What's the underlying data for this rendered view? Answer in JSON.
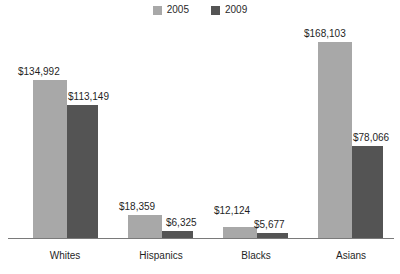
{
  "chart_data": {
    "type": "bar",
    "title": "",
    "subtitle": "",
    "xlabel": "",
    "ylabel": "",
    "grid": false,
    "legend_position": "top-center",
    "ylim": [
      0,
      185000
    ],
    "categories": [
      "Whites",
      "Hispanics",
      "Blacks",
      "Asians"
    ],
    "series": [
      {
        "name": "2005",
        "color": "#a8a8a8",
        "values": [
          134992,
          18359,
          12124,
          168103
        ],
        "labels": [
          "$134,992",
          "$18,359",
          "$12,124",
          "$168,103"
        ]
      },
      {
        "name": "2009",
        "color": "#545454",
        "values": [
          113149,
          6325,
          5677,
          78066
        ],
        "labels": [
          "$113,149",
          "$6,325",
          "$5,677",
          "$78,066"
        ]
      }
    ]
  },
  "legend": {
    "items": [
      {
        "label": "2005",
        "color": "#a8a8a8",
        "swatch_name": "legend-swatch-2005"
      },
      {
        "label": "2009",
        "color": "#545454",
        "swatch_name": "legend-swatch-2009"
      }
    ]
  },
  "axis": {
    "baseline_color": "#7a7a7a"
  },
  "bars": [
    {
      "group": "Whites",
      "series": "2005",
      "label": "$134,992",
      "x": 33,
      "w": 34,
      "top": 80,
      "color": "#a8a8a8",
      "label_x": 18,
      "label_y": 66
    },
    {
      "group": "Whites",
      "series": "2009",
      "label": "$113,149",
      "x": 67,
      "w": 31,
      "top": 105,
      "color": "#545454",
      "label_x": 68,
      "label_y": 91
    },
    {
      "group": "Hispanics",
      "series": "2005",
      "label": "$18,359",
      "x": 128,
      "w": 34,
      "top": 215,
      "color": "#a8a8a8",
      "label_x": 119,
      "label_y": 201
    },
    {
      "group": "Hispanics",
      "series": "2009",
      "label": "$6,325",
      "x": 162,
      "w": 31,
      "top": 231,
      "color": "#545454",
      "label_x": 166,
      "label_y": 217
    },
    {
      "group": "Blacks",
      "series": "2005",
      "label": "$12,124",
      "x": 223,
      "w": 34,
      "top": 227,
      "color": "#a8a8a8",
      "label_x": 214,
      "label_y": 205
    },
    {
      "group": "Blacks",
      "series": "2009",
      "label": "$5,677",
      "x": 257,
      "w": 31,
      "top": 233,
      "color": "#545454",
      "label_x": 254,
      "label_y": 219
    },
    {
      "group": "Asians",
      "series": "2005",
      "label": "$168,103",
      "x": 318,
      "w": 34,
      "top": 42,
      "color": "#a8a8a8",
      "label_x": 304,
      "label_y": 28
    },
    {
      "group": "Asians",
      "series": "2009",
      "label": "$78,066",
      "x": 352,
      "w": 31,
      "top": 146,
      "color": "#545454",
      "label_x": 353,
      "label_y": 132
    }
  ],
  "category_labels": [
    {
      "text": "Whites",
      "x": 30,
      "w": 70
    },
    {
      "text": "Hispanics",
      "x": 123,
      "w": 76
    },
    {
      "text": "Blacks",
      "x": 221,
      "w": 70
    },
    {
      "text": "Asians",
      "x": 316,
      "w": 70
    }
  ]
}
